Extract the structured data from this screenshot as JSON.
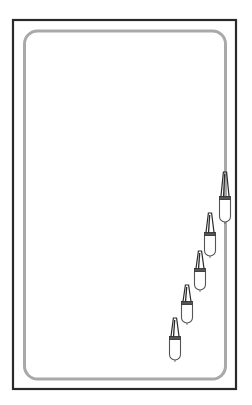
{
  "diagram": {
    "canvas": {
      "width": 252,
      "height": 405,
      "background": "#ffffff"
    },
    "outer_frame": {
      "x": 13,
      "y": 20,
      "width": 223,
      "height": 369,
      "stroke": "#2a2a2a",
      "stroke_width": 2.2
    },
    "inner_track": {
      "x": 24.5,
      "y": 31,
      "width": 201,
      "height": 348,
      "radius": 13,
      "stroke": "#a9a9a9",
      "stroke_width": 3
    },
    "pendants": [
      {
        "id": 1,
        "cx": 225,
        "tip_y": 172,
        "collar_y": 198,
        "bottom_y": 222
      },
      {
        "id": 2,
        "cx": 210,
        "tip_y": 213,
        "collar_y": 234,
        "bottom_y": 256
      },
      {
        "id": 3,
        "cx": 200,
        "tip_y": 251,
        "collar_y": 270,
        "bottom_y": 290
      },
      {
        "id": 4,
        "cx": 187,
        "tip_y": 285,
        "collar_y": 303,
        "bottom_y": 323
      },
      {
        "id": 5,
        "cx": 175,
        "tip_y": 318,
        "collar_y": 338,
        "bottom_y": 360
      }
    ],
    "colors": {
      "line_dark": "#2a2a2a",
      "line_mid": "#555555",
      "track_gray": "#a9a9a9"
    }
  }
}
